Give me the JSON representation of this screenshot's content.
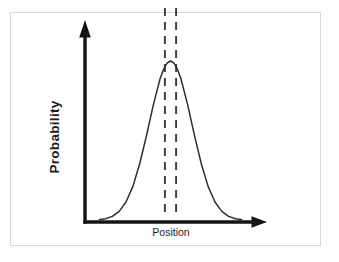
{
  "figure": {
    "ylabel": "Probability",
    "xlabel": "Position"
  },
  "colors": {
    "page_background": "#fdfdfd",
    "plot_background": "#ffffff",
    "box_border": "#d6d6d6",
    "axis": "#141414",
    "curve": "#2f2f2f",
    "dashed": "#3a3a3a",
    "label_text": "#1c1c1c"
  },
  "chart_data": {
    "type": "line",
    "title": "",
    "xlabel": "Position",
    "ylabel": "Probability",
    "x_axis_numeric_labels": false,
    "y_axis_numeric_labels": false,
    "grid": false,
    "legend": false,
    "x": [
      0.08,
      0.12,
      0.16,
      0.2,
      0.24,
      0.28,
      0.32,
      0.36,
      0.4,
      0.44,
      0.46,
      0.48,
      0.5,
      0.52,
      0.54,
      0.56,
      0.6,
      0.64,
      0.68,
      0.72,
      0.76,
      0.8,
      0.84,
      0.88,
      0.92
    ],
    "series": [
      {
        "name": "probability_density",
        "values": [
          0.0035,
          0.0098,
          0.0247,
          0.0561,
          0.115,
          0.2125,
          0.3546,
          0.5341,
          0.7261,
          0.8912,
          0.95,
          0.9873,
          1.0,
          0.9873,
          0.95,
          0.8912,
          0.7261,
          0.5341,
          0.3546,
          0.2125,
          0.115,
          0.0561,
          0.0247,
          0.0098,
          0.0035
        ]
      }
    ],
    "dashed_vertical_lines_x": [
      0.467,
      0.533
    ]
  }
}
